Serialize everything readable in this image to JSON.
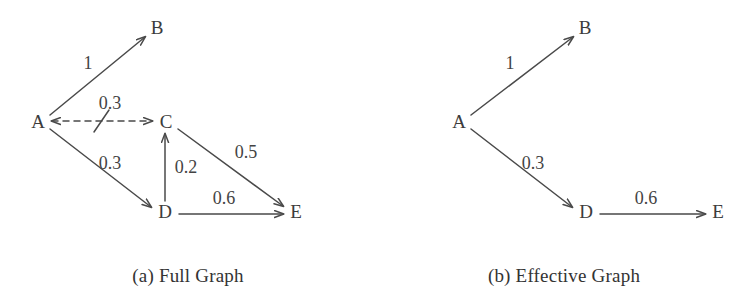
{
  "figure": {
    "background_color": "#ffffff",
    "stroke_color": "#4a4a4a",
    "text_color": "#3c3c3c"
  },
  "panels": [
    {
      "id": "full-graph",
      "caption": "(a) Full Graph",
      "nodes": [
        {
          "id": "A",
          "label": "A",
          "x": 38,
          "y": 121
        },
        {
          "id": "B",
          "label": "B",
          "x": 157,
          "y": 27
        },
        {
          "id": "C",
          "label": "C",
          "x": 166,
          "y": 121
        },
        {
          "id": "D",
          "label": "D",
          "x": 165,
          "y": 211
        },
        {
          "id": "E",
          "label": "E",
          "x": 296,
          "y": 211
        }
      ],
      "edges": [
        {
          "id": "A-B",
          "from": "A",
          "to": "B",
          "weight": "1",
          "style": "solid",
          "arrow": "forward",
          "crossed_out": false,
          "label_x": 88,
          "label_y": 63
        },
        {
          "id": "A-C",
          "from": "A",
          "to": "C",
          "weight": "0.3",
          "style": "dashed",
          "arrow": "bidirectional",
          "crossed_out": true,
          "label_x": 110,
          "label_y": 103
        },
        {
          "id": "A-D",
          "from": "A",
          "to": "D",
          "weight": "0.3",
          "style": "solid",
          "arrow": "forward",
          "crossed_out": false,
          "label_x": 110,
          "label_y": 163
        },
        {
          "id": "D-C",
          "from": "D",
          "to": "C",
          "weight": "0.2",
          "style": "solid",
          "arrow": "forward",
          "crossed_out": false,
          "label_x": 186,
          "label_y": 167
        },
        {
          "id": "C-E",
          "from": "C",
          "to": "E",
          "weight": "0.5",
          "style": "solid",
          "arrow": "forward",
          "crossed_out": false,
          "label_x": 246,
          "label_y": 152
        },
        {
          "id": "D-E",
          "from": "D",
          "to": "E",
          "weight": "0.6",
          "style": "solid",
          "arrow": "forward",
          "crossed_out": false,
          "label_x": 224,
          "label_y": 198
        }
      ]
    },
    {
      "id": "effective-graph",
      "caption": "(b) Effective Graph",
      "nodes": [
        {
          "id": "A",
          "label": "A",
          "x": 83,
          "y": 121
        },
        {
          "id": "B",
          "label": "B",
          "x": 209,
          "y": 27
        },
        {
          "id": "D",
          "label": "D",
          "x": 210,
          "y": 211
        },
        {
          "id": "E",
          "label": "E",
          "x": 342,
          "y": 211
        }
      ],
      "edges": [
        {
          "id": "A-B",
          "from": "A",
          "to": "B",
          "weight": "1",
          "style": "solid",
          "arrow": "forward",
          "crossed_out": false,
          "label_x": 134,
          "label_y": 63
        },
        {
          "id": "A-D",
          "from": "A",
          "to": "D",
          "weight": "0.3",
          "style": "solid",
          "arrow": "forward",
          "crossed_out": false,
          "label_x": 157,
          "label_y": 163
        },
        {
          "id": "D-E",
          "from": "D",
          "to": "E",
          "weight": "0.6",
          "style": "solid",
          "arrow": "forward",
          "crossed_out": false,
          "label_x": 270,
          "label_y": 198
        }
      ]
    }
  ]
}
